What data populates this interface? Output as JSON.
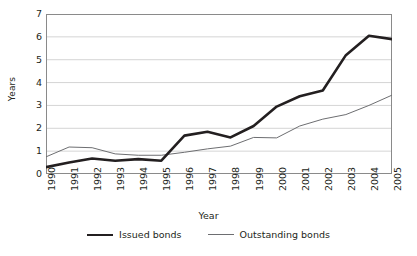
{
  "chart_data": {
    "type": "line",
    "title": "",
    "xlabel": "Year",
    "ylabel": "Years",
    "grid": true,
    "legend_position": "bottom",
    "xlim": [
      1990,
      2005
    ],
    "ylim": [
      0,
      7
    ],
    "y_ticks": [
      7,
      6,
      5,
      4,
      3,
      2,
      1,
      0
    ],
    "categories": [
      "1990",
      "1991",
      "1992",
      "1993",
      "1994",
      "1995",
      "1996",
      "1997",
      "1998",
      "1999",
      "2000",
      "2001",
      "2002",
      "2003",
      "2004",
      "2005"
    ],
    "series": [
      {
        "name": "Issued bonds",
        "style": "thick",
        "color": "#231f20",
        "values": [
          0.3,
          0.5,
          0.68,
          0.58,
          0.65,
          0.58,
          1.68,
          1.85,
          1.6,
          2.1,
          2.95,
          3.4,
          3.65,
          5.2,
          6.05,
          5.9
        ]
      },
      {
        "name": "Outstanding bonds",
        "style": "thin",
        "color": "#6d6e71",
        "values": [
          0.75,
          1.18,
          1.15,
          0.88,
          0.82,
          0.82,
          0.95,
          1.1,
          1.22,
          1.6,
          1.58,
          2.1,
          2.4,
          2.6,
          3.0,
          3.45
        ]
      }
    ]
  },
  "legend": {
    "items": [
      {
        "label": "Issued bonds"
      },
      {
        "label": "Outstanding bonds"
      }
    ]
  }
}
